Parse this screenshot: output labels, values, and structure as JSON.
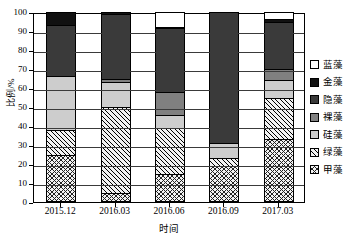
{
  "chart_data": {
    "type": "bar",
    "subtype": "stacked-percentage",
    "title": "",
    "xlabel": "时间",
    "ylabel": "比例/%",
    "ylim": [
      0,
      100
    ],
    "yticks": [
      0,
      10,
      20,
      30,
      40,
      50,
      60,
      70,
      80,
      90,
      100
    ],
    "grid": true,
    "legend_position": "right",
    "categories": [
      "2015.12",
      "2016.03",
      "2016.06",
      "2016.09",
      "2017.03"
    ],
    "series": [
      {
        "name": "甲藻",
        "fill": "cross-hatch",
        "values": [
          24.5,
          5.0,
          14.5,
          19.0,
          33.0
        ]
      },
      {
        "name": "绿藻",
        "fill": "diagonal-hatch",
        "values": [
          13.5,
          45.0,
          24.5,
          4.0,
          22.0
        ]
      },
      {
        "name": "硅藻",
        "fill": "light-gray",
        "values": [
          28.5,
          13.0,
          7.0,
          8.0,
          9.0
        ]
      },
      {
        "name": "裸藻",
        "fill": "medium-gray",
        "values": [
          0.0,
          2.0,
          12.0,
          0.0,
          6.0
        ]
      },
      {
        "name": "隐藻",
        "fill": "dark-gray",
        "values": [
          26.5,
          34.0,
          33.5,
          69.0,
          25.0
        ]
      },
      {
        "name": "金藻",
        "fill": "black",
        "values": [
          7.0,
          1.0,
          0.5,
          0.0,
          1.5
        ]
      },
      {
        "name": "蓝藻",
        "fill": "white",
        "values": [
          0.0,
          0.0,
          8.0,
          0.0,
          3.5
        ]
      }
    ]
  },
  "legend": {
    "items": [
      {
        "label": "蓝藻",
        "fill": "white"
      },
      {
        "label": "金藻",
        "fill": "black"
      },
      {
        "label": "隐藻",
        "fill": "dark-gray"
      },
      {
        "label": "裸藻",
        "fill": "medium-gray"
      },
      {
        "label": "硅藻",
        "fill": "light-gray"
      },
      {
        "label": "绿藻",
        "fill": "diagonal-hatch"
      },
      {
        "label": "甲藻",
        "fill": "cross-hatch"
      }
    ]
  },
  "colors": {
    "black": "#111111",
    "dark_gray": "#3a3a3a",
    "medium_gray": "#808080",
    "light_gray": "#cdcdcd",
    "white": "#ffffff",
    "axis": "#000000"
  }
}
